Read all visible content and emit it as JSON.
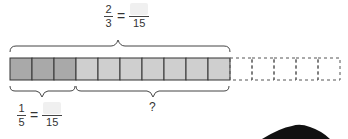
{
  "diagram": {
    "total_cells": 15,
    "solid_cells": 10,
    "dark_cells": 3,
    "light_cells": 7,
    "dashed_cells": 5,
    "colors": {
      "dark": "#a9a9a9",
      "light": "#cfcfcf",
      "border": "#333333",
      "dashed": "#555555"
    }
  },
  "top_label": {
    "left": {
      "numerator": "2",
      "denominator": "3"
    },
    "equals": "=",
    "right": {
      "numerator": "",
      "denominator": "15"
    }
  },
  "bottom_left_label": {
    "left": {
      "numerator": "1",
      "denominator": "5"
    },
    "equals": "=",
    "right": {
      "numerator": "",
      "denominator": "15"
    }
  },
  "bottom_right_label": "?"
}
